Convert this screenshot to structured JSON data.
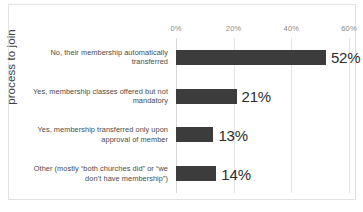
{
  "chart_data": {
    "type": "bar",
    "orientation": "horizontal",
    "title": "",
    "xlabel": "",
    "ylabel": "process to join",
    "categories": [
      "No, their membership automatically transferred",
      "Yes, membership classes offered but not mandatory",
      "Yes, membership transferred only upon approval of member",
      "Other (mostly “both churches did” or “we don’t have membership”)"
    ],
    "values": [
      52,
      21,
      13,
      14
    ],
    "data_labels": [
      "52%",
      "21%",
      "13%",
      "14%"
    ],
    "xlim": [
      0,
      60
    ],
    "xticks": [
      0,
      20,
      40,
      60
    ],
    "xtick_labels": [
      "0%",
      "20%",
      "40%",
      "60%"
    ],
    "grid": true,
    "grid_axis": "x",
    "legend": false,
    "bar_color": "#3c3c3c",
    "gridline_color": "#e4e4e4",
    "frame_color": "#e2e2e2"
  },
  "axis": {
    "y_title": "process to join"
  },
  "ticks": [
    {
      "label": "0%",
      "value": 0
    },
    {
      "label": "20%",
      "value": 20
    },
    {
      "label": "40%",
      "value": 40
    },
    {
      "label": "60%",
      "value": 60
    }
  ],
  "bars": [
    {
      "label": "No, their membership automatically transferred",
      "value": 52,
      "data_label": "52%"
    },
    {
      "label": "Yes, membership classes offered but not mandatory",
      "value": 21,
      "data_label": "21%"
    },
    {
      "label": "Yes, membership transferred only upon approval of member",
      "value": 13,
      "data_label": "13%"
    },
    {
      "label": "Other (mostly “both churches did” or “we don’t have membership”)",
      "value": 14,
      "data_label": "14%"
    }
  ]
}
